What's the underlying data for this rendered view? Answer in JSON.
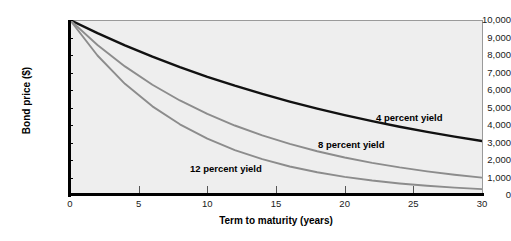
{
  "chart_data": {
    "type": "line",
    "title": "",
    "xlabel": "Term to maturity (years)",
    "ylabel": "Bond price ($)",
    "xlim": [
      0,
      30
    ],
    "ylim": [
      0,
      10000
    ],
    "xticks": [
      0,
      5,
      10,
      15,
      20,
      25,
      30
    ],
    "xtick_labels": [
      "0",
      "5",
      "10",
      "15",
      "20",
      "25",
      "30"
    ],
    "yticks": [
      0,
      1000,
      2000,
      3000,
      4000,
      5000,
      6000,
      7000,
      8000,
      9000,
      10000
    ],
    "ytick_labels": [
      "0",
      "1,000",
      "2,000",
      "3,000",
      "4,000",
      "5,000",
      "6,000",
      "7,000",
      "8,000",
      "9,000",
      "10,000"
    ],
    "grid": false,
    "legend_position": "inline-annotations",
    "x": [
      0,
      2,
      4,
      6,
      8,
      10,
      12,
      14,
      16,
      18,
      20,
      22,
      24,
      26,
      28,
      30
    ],
    "series": [
      {
        "name": "4 percent yield",
        "label": "4 percent yield",
        "color": "#111111",
        "values": [
          10000,
          9246,
          8548,
          7903,
          7307,
          6756,
          6246,
          5775,
          5339,
          4936,
          4564,
          4220,
          3901,
          3607,
          3335,
          3083
        ]
      },
      {
        "name": "8 percent yield",
        "label": "8 percent yield",
        "color": "#8c8c8c",
        "values": [
          10000,
          8573,
          7350,
          6302,
          5403,
          4632,
          3971,
          3405,
          2919,
          2502,
          2145,
          1839,
          1577,
          1352,
          1159,
          994
        ]
      },
      {
        "name": "12 percent yield",
        "label": "12 percent yield",
        "color": "#8c8c8c",
        "values": [
          10000,
          7972,
          6355,
          5066,
          4039,
          3220,
          2567,
          2046,
          1631,
          1300,
          1037,
          827,
          659,
          525,
          419,
          334
        ]
      }
    ],
    "colors": {
      "plot_background": "#eeeeee",
      "axis": "#000000",
      "frame": "#9a9a9a",
      "series_primary": "#111111",
      "series_secondary": "#8c8c8c"
    }
  }
}
